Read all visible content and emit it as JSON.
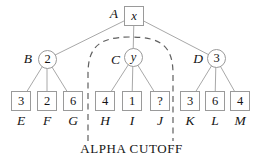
{
  "figure": {
    "caption": "ALPHA CUTOFF",
    "tree": {
      "root": {
        "label": "A",
        "value": "x"
      },
      "internal": [
        {
          "label": "B",
          "value": "2"
        },
        {
          "label": "C",
          "value": "y"
        },
        {
          "label": "D",
          "value": "3"
        }
      ],
      "leaves": [
        {
          "label": "E",
          "value": "3"
        },
        {
          "label": "F",
          "value": "2"
        },
        {
          "label": "G",
          "value": "6"
        },
        {
          "label": "H",
          "value": "4"
        },
        {
          "label": "I",
          "value": "1"
        },
        {
          "label": "J",
          "value": "?"
        },
        {
          "label": "K",
          "value": "3"
        },
        {
          "label": "L",
          "value": "6"
        },
        {
          "label": "M",
          "value": "4"
        }
      ]
    },
    "colors": {
      "edge": "#a8a8a8",
      "border": "#9a9a9a",
      "cutoff": "#5f5f5f",
      "text": "#141414"
    }
  }
}
